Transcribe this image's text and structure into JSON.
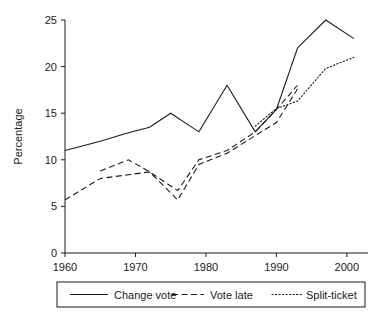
{
  "chart_data": {
    "type": "line",
    "title": "",
    "xlabel": "",
    "ylabel": "Percentage",
    "xlim": [
      1960,
      2003
    ],
    "ylim": [
      0,
      25
    ],
    "xticks": [
      1960,
      1970,
      1980,
      1990,
      2000
    ],
    "yticks": [
      0,
      5,
      10,
      15,
      20,
      25
    ],
    "xtick_labels": [
      "1960",
      "1970",
      "1980",
      "1990",
      "2000"
    ],
    "ytick_labels": [
      "0",
      "5",
      "10",
      "15",
      "20",
      "25"
    ],
    "grid": false,
    "legend_position": "bottom",
    "series": [
      {
        "name": "Change vote",
        "style": "solid",
        "color": "#1a1a1a",
        "x": [
          1960,
          1965,
          1969,
          1972,
          1975,
          1979,
          1983,
          1987,
          1990,
          1993,
          1997,
          2001
        ],
        "values": [
          11.0,
          12.0,
          12.9,
          13.5,
          15.0,
          13.0,
          18.0,
          13.0,
          15.4,
          22.0,
          25.0,
          23.0
        ]
      },
      {
        "name": "Vote late",
        "style": "dashed",
        "color": "#1a1a1a",
        "x": [
          1965,
          1969,
          1972,
          1976,
          1979,
          1983,
          1987,
          1990,
          1993
        ],
        "values": [
          8.8,
          10.0,
          8.7,
          6.7,
          10.0,
          11.0,
          13.0,
          15.4,
          18.0
        ]
      },
      {
        "name": "Split-ticket",
        "style": "dotted",
        "color": "#1a1a1a",
        "x": [
          1987,
          1990,
          1993,
          1997,
          2001
        ],
        "values": [
          13.6,
          15.5,
          16.3,
          19.8,
          21.0
        ]
      },
      {
        "name": "Vote late (early)",
        "style": "dashed",
        "color": "#1a1a1a",
        "x": [
          1960,
          1965,
          1969,
          1972,
          1976,
          1979,
          1983,
          1987,
          1990,
          1993
        ],
        "values": [
          5.7,
          8.0,
          8.4,
          8.7,
          5.7,
          9.5,
          10.7,
          12.6,
          14.0,
          17.6
        ]
      }
    ],
    "legend": [
      {
        "label": "Change vote",
        "style": "solid"
      },
      {
        "label": "Vote late",
        "style": "dashed"
      },
      {
        "label": "Split-ticket",
        "style": "dotted"
      }
    ]
  }
}
